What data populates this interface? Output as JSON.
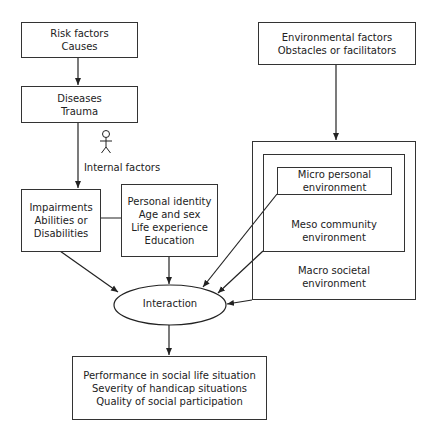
{
  "diagram": {
    "nodes": {
      "risk_factors": {
        "lines": [
          "Risk factors",
          "Causes"
        ]
      },
      "diseases": {
        "lines": [
          "Diseases",
          "Trauma"
        ]
      },
      "internal_factors": {
        "label": "Internal factors"
      },
      "impairments": {
        "lines": [
          "Impairments",
          "Abilities or",
          "Disabilities"
        ]
      },
      "personal_identity": {
        "lines": [
          "Personal identity",
          "Age and sex",
          "Life experience",
          "Education"
        ]
      },
      "environmental_factors": {
        "lines": [
          "Environmental factors",
          "Obstacles or facilitators"
        ]
      },
      "micro": {
        "lines": [
          "Micro personal",
          "environment"
        ]
      },
      "meso": {
        "lines": [
          "Meso community",
          "environment"
        ]
      },
      "macro": {
        "lines": [
          "Macro societal",
          "environment"
        ]
      },
      "interaction": {
        "label": "Interaction"
      },
      "outcomes": {
        "lines": [
          "Performance in social life situation",
          "Severity of handicap situations",
          "Quality of social participation"
        ]
      }
    },
    "edges": [
      {
        "from": "risk_factors",
        "to": "diseases"
      },
      {
        "from": "diseases",
        "to": "impairments"
      },
      {
        "from": "impairments",
        "to": "personal_identity",
        "bidirectional": true
      },
      {
        "from": "environmental_factors",
        "to": "macro"
      },
      {
        "from": "impairments",
        "to": "interaction"
      },
      {
        "from": "personal_identity",
        "to": "interaction"
      },
      {
        "from": "micro",
        "to": "interaction"
      },
      {
        "from": "meso",
        "to": "interaction"
      },
      {
        "from": "macro",
        "to": "interaction"
      },
      {
        "from": "interaction",
        "to": "outcomes"
      }
    ],
    "icons": {
      "person": "person-figure-icon"
    }
  }
}
